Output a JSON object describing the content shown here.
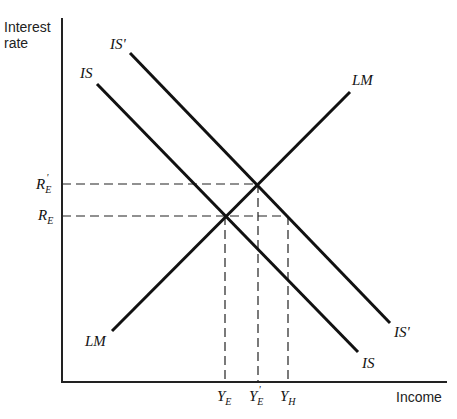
{
  "diagram": {
    "type": "IS-LM diagram",
    "axes": {
      "y_label_line1": "Interest",
      "y_label_line2": "rate",
      "x_label": "Income"
    },
    "curves": {
      "is_top_label": "IS",
      "is_bottom_label": "IS",
      "is_prime_top_label": "IS'",
      "is_prime_bottom_label": "IS'",
      "lm_top_label": "LM",
      "lm_bottom_label": "LM"
    },
    "y_ticks": {
      "r_e_prime": {
        "main": "R",
        "sub": "E",
        "prime": "'"
      },
      "r_e": {
        "main": "R",
        "sub": "E"
      }
    },
    "x_ticks": {
      "y_e": {
        "main": "Y",
        "sub": "E"
      },
      "y_e_prime": {
        "main": "Y",
        "sub": "E",
        "prime": "'"
      },
      "y_h": {
        "main": "Y",
        "sub": "H"
      }
    },
    "colors": {
      "line": "#111111",
      "background": "#ffffff"
    }
  }
}
